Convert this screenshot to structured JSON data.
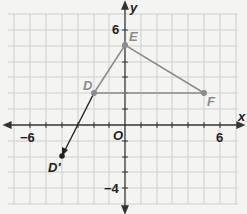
{
  "axes": {
    "x_label": "x",
    "y_label": "y",
    "origin_label": "O",
    "x_ticks": [
      {
        "value": -6,
        "label": "−6"
      },
      {
        "value": 6,
        "label": "6"
      }
    ],
    "y_ticks": [
      {
        "value": 6,
        "label": "6"
      },
      {
        "value": -4,
        "label": "−4"
      }
    ],
    "x_range": [
      -7,
      7
    ],
    "y_range": [
      -5,
      7
    ]
  },
  "triangle": {
    "color": "#8c8c8c",
    "vertices": [
      {
        "name": "D",
        "x": -2,
        "y": 2
      },
      {
        "name": "E",
        "x": 0,
        "y": 5
      },
      {
        "name": "F",
        "x": 5,
        "y": 2
      }
    ]
  },
  "image_point": {
    "name": "D′",
    "x": -4,
    "y": -2,
    "color": "#222222"
  },
  "vector": {
    "from": "D",
    "to": "D′"
  }
}
